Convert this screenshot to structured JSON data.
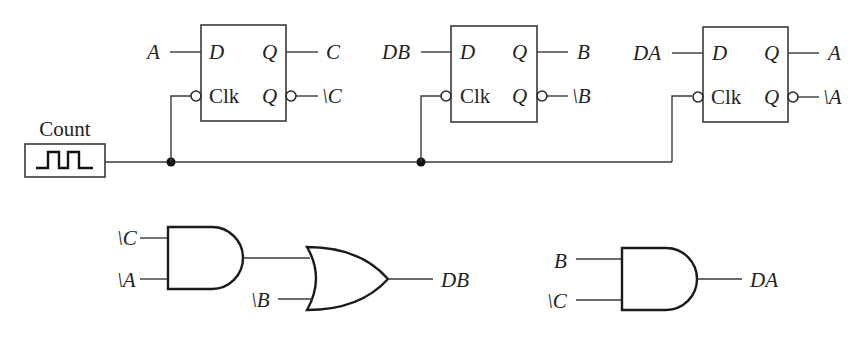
{
  "diagram": {
    "title": "",
    "type": "digital logic circuit (3-bit counter with D flip-flops)",
    "clock_source": {
      "label": "Count",
      "icon": "square-wave-icon"
    },
    "flip_flops": [
      {
        "id": "ff-c",
        "pins": {
          "d": "D",
          "clk": "Clk",
          "q": "Q",
          "qbar": "Q"
        },
        "input_label": "A",
        "q_label": "C",
        "qbar_label": "\\C"
      },
      {
        "id": "ff-b",
        "pins": {
          "d": "D",
          "clk": "Clk",
          "q": "Q",
          "qbar": "Q"
        },
        "input_label": "DB",
        "q_label": "B",
        "qbar_label": "\\B"
      },
      {
        "id": "ff-a",
        "pins": {
          "d": "D",
          "clk": "Clk",
          "q": "Q",
          "qbar": "Q"
        },
        "input_label": "DA",
        "q_label": "A",
        "qbar_label": "\\A"
      }
    ],
    "gates": {
      "and1": {
        "type": "AND",
        "inputs": [
          "\\C",
          "\\A"
        ]
      },
      "or1": {
        "type": "OR",
        "inputs": [
          "and1",
          "\\B"
        ],
        "output_label": "DB"
      },
      "and2": {
        "type": "AND",
        "inputs": [
          "B",
          "\\C"
        ],
        "output_label": "DA"
      }
    },
    "colors": {
      "line": "#3a3a3a",
      "gate_outline": "#1a1a1a",
      "background": "#ffffff"
    }
  }
}
